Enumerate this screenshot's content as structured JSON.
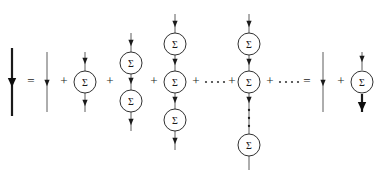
{
  "figure": {
    "background_color": "#ffffff",
    "ink_color": "#1a1a1a",
    "line_color": "#4a4a4a",
    "width": 379,
    "height": 182,
    "baseline_y": 82
  },
  "glyphs": {
    "sigma": "Σ",
    "plus": "+",
    "equals": "=",
    "ellipsis_dot": "·"
  },
  "operators": [
    {
      "name": "equals-1",
      "symbol": "=",
      "x": 31,
      "y": 82
    },
    {
      "name": "plus-1",
      "symbol": "+",
      "x": 64,
      "y": 82
    },
    {
      "name": "plus-2",
      "symbol": "+",
      "x": 110,
      "y": 82
    },
    {
      "name": "plus-3",
      "symbol": "+",
      "x": 154,
      "y": 82
    },
    {
      "name": "plus-4",
      "symbol": "+",
      "x": 196,
      "y": 82
    },
    {
      "name": "plus-5",
      "symbol": "+",
      "x": 232,
      "y": 82
    },
    {
      "name": "plus-6",
      "symbol": "+",
      "x": 270,
      "y": 82
    },
    {
      "name": "equals-2",
      "symbol": "=",
      "x": 307,
      "y": 82
    },
    {
      "name": "plus-7",
      "symbol": "+",
      "x": 341,
      "y": 82
    }
  ],
  "ellipses": [
    {
      "name": "horizontal-ellipsis-1",
      "cy": 82,
      "dots": [
        206,
        212,
        218,
        224
      ]
    },
    {
      "name": "horizontal-ellipsis-2",
      "cy": 82,
      "dots": [
        280,
        286,
        292,
        298
      ]
    }
  ],
  "terms": [
    {
      "name": "full-propagator-lhs",
      "label": "full propagator",
      "x": 12,
      "line": {
        "top": 48,
        "bottom": 116,
        "weight": "thick"
      },
      "arrow": {
        "y": 84,
        "weight": "thick"
      },
      "nodes": []
    },
    {
      "name": "bare-propagator-term",
      "label": "bare propagator",
      "x": 47,
      "line": {
        "top": 52,
        "bottom": 112,
        "weight": "thin"
      },
      "arrow": {
        "y": 84,
        "weight": "thin"
      },
      "nodes": []
    },
    {
      "name": "first-order-self-energy-term",
      "label": "one self-energy insertion",
      "x": 85,
      "line": {
        "top": 52,
        "bottom": 112,
        "weight": "thin"
      },
      "arrows": [
        {
          "y": 62
        },
        {
          "y": 104
        }
      ],
      "nodes": [
        {
          "cy": 82,
          "label": "Σ"
        }
      ]
    },
    {
      "name": "second-order-self-energy-term",
      "label": "two self-energy insertions",
      "x": 131,
      "line": {
        "top": 33,
        "bottom": 131,
        "weight": "thin"
      },
      "arrows": [
        {
          "y": 44
        },
        {
          "y": 82
        },
        {
          "y": 123
        }
      ],
      "nodes": [
        {
          "cy": 63,
          "label": "Σ"
        },
        {
          "cy": 101,
          "label": "Σ"
        }
      ]
    },
    {
      "name": "third-order-self-energy-term",
      "label": "three self-energy insertions",
      "x": 175,
      "line": {
        "top": 14,
        "bottom": 150,
        "weight": "thin"
      },
      "arrows": [
        {
          "y": 25
        },
        {
          "y": 63
        },
        {
          "y": 101
        },
        {
          "y": 142
        }
      ],
      "nodes": [
        {
          "cy": 44,
          "label": "Σ"
        },
        {
          "cy": 82,
          "label": "Σ"
        },
        {
          "cy": 120,
          "label": "Σ"
        }
      ]
    },
    {
      "name": "nth-order-self-energy-term",
      "label": "n self-energy insertions",
      "x": 249,
      "line": {
        "top": 14,
        "bottom": 170,
        "weight": "thin"
      },
      "arrows": [
        {
          "y": 25
        },
        {
          "y": 63
        },
        {
          "y": 101
        }
      ],
      "nodes": [
        {
          "cy": 44,
          "label": "Σ"
        },
        {
          "cy": 82,
          "label": "Σ"
        },
        {
          "cy": 145,
          "label": "Σ"
        }
      ],
      "vertical_ellipsis": {
        "cx_offset": 0,
        "dots": [
          110,
          118,
          126
        ]
      }
    },
    {
      "name": "bare-propagator-rhs-term",
      "label": "bare propagator",
      "x": 323,
      "line": {
        "top": 52,
        "bottom": 112,
        "weight": "thin"
      },
      "arrow": {
        "y": 84,
        "weight": "thin"
      },
      "nodes": []
    },
    {
      "name": "self-energy-times-full-propagator-term",
      "label": "self-energy times full propagator",
      "x": 362,
      "line": {
        "top": 52,
        "bottom": 70,
        "weight": "thin"
      },
      "line_lower": {
        "top": 94,
        "bottom": 112,
        "weight": "thick"
      },
      "arrows": [
        {
          "y": 60,
          "weight": "thin"
        }
      ],
      "arrows_thick": [
        {
          "y": 108,
          "weight": "thick"
        }
      ],
      "nodes": [
        {
          "cy": 82,
          "label": "Σ"
        }
      ]
    }
  ],
  "node_style": {
    "radius": 11,
    "fill": "#ffffff",
    "stroke": "#1a1a1a",
    "stroke_width": 0.9
  }
}
